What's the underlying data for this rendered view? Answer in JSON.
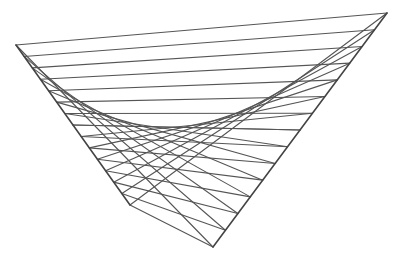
{
  "figure": {
    "type": "string-art parabola envelope",
    "background": "#ffffff",
    "stroke_color": "#555555",
    "leg_color": "#444444",
    "line_width": 1.1,
    "leg_width": 1.6,
    "segments": 14,
    "left_leg": {
      "start": [
        16,
        45
      ],
      "end": [
        130,
        205
      ]
    },
    "right_leg": {
      "start": [
        213,
        247
      ],
      "end": [
        387,
        13
      ]
    }
  }
}
